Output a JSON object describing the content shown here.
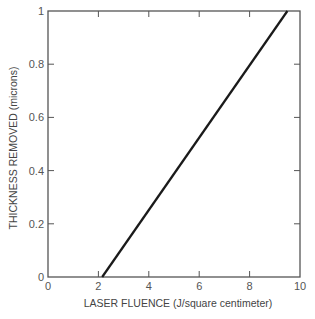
{
  "chart_data": {
    "type": "line",
    "title": "",
    "xlabel": "LASER FLUENCE (J/square centimeter)",
    "ylabel": "THICKNESS REMOVED (microns)",
    "xlim": [
      0,
      10
    ],
    "ylim": [
      0,
      1
    ],
    "x_ticks": [
      0,
      2,
      4,
      6,
      8,
      10
    ],
    "x_tick_labels": [
      "0",
      "2",
      "4",
      "6",
      "8",
      "10"
    ],
    "y_ticks": [
      0,
      0.2,
      0.4,
      0.6,
      0.8,
      1
    ],
    "y_tick_labels": [
      "0",
      "0.2",
      "0.4",
      "0.6",
      "0.8",
      "1"
    ],
    "grid": false,
    "legend": null,
    "series": [
      {
        "name": "thickness removed",
        "x": [
          2.15,
          9.5
        ],
        "y": [
          0,
          1.0
        ],
        "color": "#1a1a1a"
      }
    ]
  },
  "colors": {
    "axis": "#555555",
    "line": "#1a1a1a",
    "text": "#555555"
  }
}
